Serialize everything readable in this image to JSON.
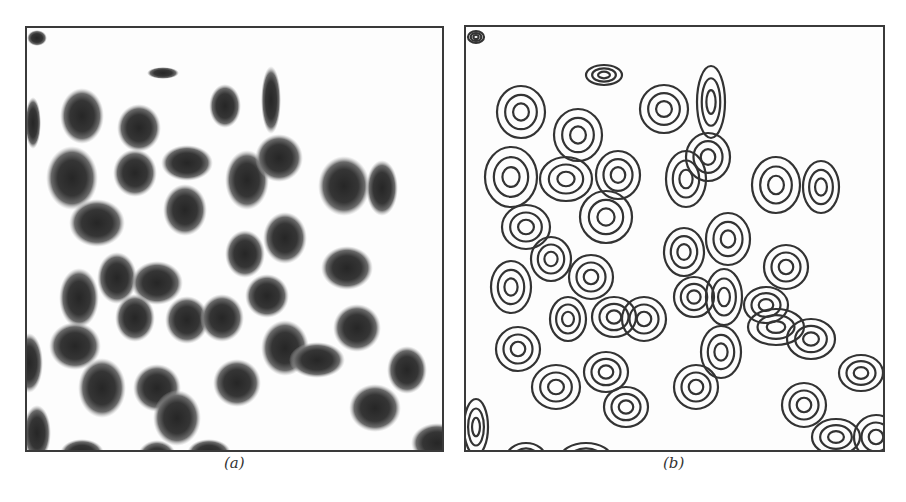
{
  "figure": {
    "panels": [
      {
        "id": "a",
        "caption": "(a)",
        "kind": "grayscale blob image",
        "ink": "#2e2e2e"
      },
      {
        "id": "b",
        "caption": "(b)",
        "kind": "contour image",
        "ink": "#333333"
      }
    ]
  },
  "blobs": [
    [
      10,
      10,
      10,
      8
    ],
    [
      136,
      45,
      16,
      6
    ],
    [
      55,
      88,
      22,
      28
    ],
    [
      6,
      95,
      8,
      26
    ],
    [
      112,
      100,
      22,
      24
    ],
    [
      198,
      78,
      16,
      22
    ],
    [
      244,
      72,
      10,
      34
    ],
    [
      45,
      150,
      26,
      32
    ],
    [
      108,
      145,
      22,
      24
    ],
    [
      160,
      135,
      26,
      18
    ],
    [
      220,
      152,
      22,
      30
    ],
    [
      252,
      130,
      24,
      24
    ],
    [
      317,
      158,
      26,
      30
    ],
    [
      355,
      160,
      16,
      28
    ],
    [
      70,
      195,
      28,
      24
    ],
    [
      158,
      182,
      22,
      26
    ],
    [
      218,
      226,
      20,
      24
    ],
    [
      258,
      210,
      22,
      26
    ],
    [
      320,
      240,
      26,
      22
    ],
    [
      52,
      270,
      20,
      30
    ],
    [
      90,
      250,
      20,
      26
    ],
    [
      130,
      255,
      26,
      22
    ],
    [
      48,
      318,
      26,
      24
    ],
    [
      108,
      290,
      20,
      24
    ],
    [
      160,
      292,
      22,
      24
    ],
    [
      195,
      290,
      22,
      24
    ],
    [
      240,
      268,
      22,
      22
    ],
    [
      330,
      300,
      24,
      24
    ],
    [
      380,
      342,
      20,
      24
    ],
    [
      2,
      335,
      14,
      30
    ],
    [
      130,
      360,
      24,
      24
    ],
    [
      75,
      360,
      24,
      30
    ],
    [
      150,
      390,
      24,
      28
    ],
    [
      210,
      355,
      24,
      24
    ],
    [
      258,
      320,
      24,
      28
    ],
    [
      290,
      332,
      28,
      18
    ],
    [
      348,
      380,
      26,
      24
    ],
    [
      410,
      415,
      26,
      20
    ],
    [
      10,
      405,
      14,
      28
    ],
    [
      55,
      425,
      22,
      14
    ],
    [
      130,
      430,
      20,
      18
    ],
    [
      182,
      425,
      22,
      14
    ]
  ],
  "contour_blobs": [
    [
      10,
      10,
      8,
      6
    ],
    [
      138,
      48,
      18,
      10
    ],
    [
      55,
      85,
      24,
      26
    ],
    [
      112,
      108,
      24,
      26
    ],
    [
      198,
      82,
      24,
      24
    ],
    [
      245,
      75,
      14,
      36
    ],
    [
      45,
      150,
      26,
      30
    ],
    [
      100,
      152,
      26,
      22
    ],
    [
      152,
      148,
      22,
      24
    ],
    [
      220,
      152,
      20,
      28
    ],
    [
      242,
      130,
      22,
      24
    ],
    [
      310,
      158,
      24,
      28
    ],
    [
      355,
      160,
      18,
      26
    ],
    [
      60,
      200,
      24,
      22
    ],
    [
      140,
      190,
      26,
      26
    ],
    [
      218,
      225,
      20,
      24
    ],
    [
      262,
      212,
      22,
      26
    ],
    [
      320,
      240,
      22,
      22
    ],
    [
      45,
      260,
      20,
      26
    ],
    [
      85,
      232,
      20,
      22
    ],
    [
      125,
      250,
      22,
      22
    ],
    [
      52,
      322,
      22,
      22
    ],
    [
      102,
      292,
      18,
      22
    ],
    [
      148,
      290,
      22,
      20
    ],
    [
      178,
      292,
      22,
      22
    ],
    [
      228,
      270,
      20,
      20
    ],
    [
      258,
      270,
      18,
      28
    ],
    [
      300,
      278,
      22,
      18
    ],
    [
      345,
      312,
      24,
      20
    ],
    [
      395,
      346,
      22,
      18
    ],
    [
      140,
      345,
      22,
      20
    ],
    [
      90,
      360,
      24,
      22
    ],
    [
      160,
      380,
      22,
      20
    ],
    [
      230,
      360,
      22,
      22
    ],
    [
      255,
      325,
      20,
      26
    ],
    [
      310,
      300,
      28,
      18
    ],
    [
      338,
      378,
      22,
      22
    ],
    [
      410,
      410,
      22,
      22
    ],
    [
      370,
      410,
      24,
      18
    ],
    [
      10,
      400,
      12,
      28
    ],
    [
      60,
      432,
      20,
      16
    ],
    [
      120,
      432,
      26,
      16
    ]
  ]
}
